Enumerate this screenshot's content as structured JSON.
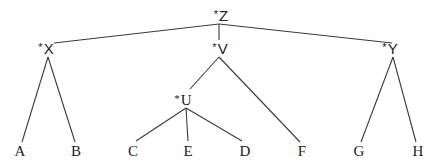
{
  "diagram": {
    "type": "tree",
    "nodes": {
      "Z": {
        "label": "Z",
        "marker": "*",
        "x": 221,
        "y": 15
      },
      "X": {
        "label": "X",
        "marker": "*",
        "x": 46,
        "y": 48
      },
      "V": {
        "label": "V",
        "marker": "*",
        "x": 220,
        "y": 48
      },
      "Y": {
        "label": "Y",
        "marker": "*",
        "x": 390,
        "y": 48
      },
      "U": {
        "label": "U",
        "marker": "*",
        "x": 183,
        "y": 100
      },
      "A": {
        "label": "A",
        "x": 20,
        "y": 151
      },
      "B": {
        "label": "B",
        "x": 76,
        "y": 151
      },
      "C": {
        "label": "C",
        "x": 133,
        "y": 151
      },
      "E": {
        "label": "E",
        "x": 188,
        "y": 151
      },
      "D": {
        "label": "D",
        "x": 245,
        "y": 151
      },
      "F": {
        "label": "F",
        "x": 302,
        "y": 151
      },
      "G": {
        "label": "G",
        "x": 359,
        "y": 151
      },
      "H": {
        "label": "H",
        "x": 418,
        "y": 151
      }
    },
    "edges": [
      {
        "from": "Z",
        "to": "X",
        "x1": 219,
        "y1": 24,
        "x2": 54,
        "y2": 43
      },
      {
        "from": "Z",
        "to": "V",
        "x1": 219,
        "y1": 24,
        "x2": 219,
        "y2": 40
      },
      {
        "from": "Z",
        "to": "Y",
        "x1": 219,
        "y1": 24,
        "x2": 392,
        "y2": 43
      },
      {
        "from": "X",
        "to": "A",
        "x1": 48,
        "y1": 57,
        "x2": 22,
        "y2": 142
      },
      {
        "from": "X",
        "to": "B",
        "x1": 48,
        "y1": 57,
        "x2": 75,
        "y2": 142
      },
      {
        "from": "V",
        "to": "U",
        "x1": 219,
        "y1": 57,
        "x2": 190,
        "y2": 89
      },
      {
        "from": "V",
        "to": "F",
        "x1": 219,
        "y1": 57,
        "x2": 300,
        "y2": 142
      },
      {
        "from": "U",
        "to": "C",
        "x1": 186,
        "y1": 108,
        "x2": 136,
        "y2": 141
      },
      {
        "from": "U",
        "to": "E",
        "x1": 186,
        "y1": 108,
        "x2": 188,
        "y2": 141
      },
      {
        "from": "U",
        "to": "D",
        "x1": 186,
        "y1": 108,
        "x2": 242,
        "y2": 141
      },
      {
        "from": "Y",
        "to": "G",
        "x1": 393,
        "y1": 57,
        "x2": 361,
        "y2": 142
      },
      {
        "from": "Y",
        "to": "H",
        "x1": 393,
        "y1": 57,
        "x2": 416,
        "y2": 142
      }
    ],
    "colors": {
      "line": "#3a3a3a",
      "text": "#222222",
      "background": "#ffffff"
    }
  }
}
